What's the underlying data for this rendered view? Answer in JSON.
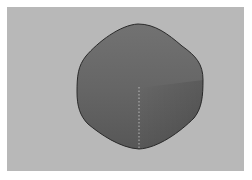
{
  "viewport": {
    "background_color": "#b8b8b8",
    "frame_color": "#ffffff"
  },
  "object": {
    "shape": "rounded-cube",
    "fill_top_color": "#6f6f6f",
    "fill_bottom_color": "#5a5a5a",
    "outline_color": "#2a2a2a",
    "center_edge_style": "dashed"
  }
}
